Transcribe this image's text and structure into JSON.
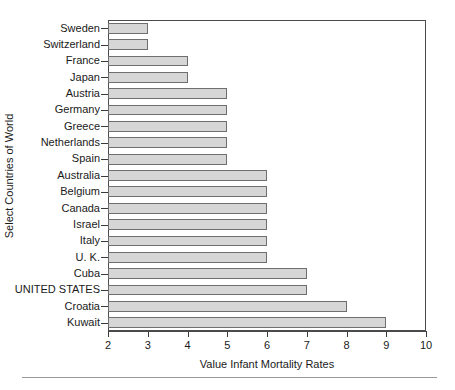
{
  "chart_data": {
    "type": "bar",
    "orientation": "horizontal",
    "title": "",
    "xlabel": "Value Infant Mortality Rates",
    "ylabel": "Select Countries of World",
    "categories": [
      "Sweden",
      "Switzerland",
      "France",
      "Japan",
      "Austria",
      "Germany",
      "Greece",
      "Netherlands",
      "Spain",
      "Australia",
      "Belgium",
      "Canada",
      "Israel",
      "Italy",
      "U. K.",
      "Cuba",
      "UNITED STATES",
      "Croatia",
      "Kuwait"
    ],
    "values": [
      3,
      3,
      4,
      4,
      5,
      5,
      5,
      5,
      5,
      6,
      6,
      6,
      6,
      6,
      6,
      7,
      7,
      8,
      9
    ],
    "xlim": [
      2,
      10
    ],
    "xticks": [
      2,
      3,
      4,
      5,
      6,
      7,
      8,
      9,
      10
    ],
    "xticklabels": [
      "2",
      "3",
      "4",
      "5",
      "6",
      "7",
      "8",
      "9",
      "10"
    ],
    "grid": false,
    "legend": null,
    "bar_fill_color": "#d6d6d6",
    "bar_edge_color": "#6e6e6e",
    "axis_color": "#4a4a4a",
    "background_color": "#ffffff"
  },
  "figure": {
    "footer_rule_visible": true
  }
}
